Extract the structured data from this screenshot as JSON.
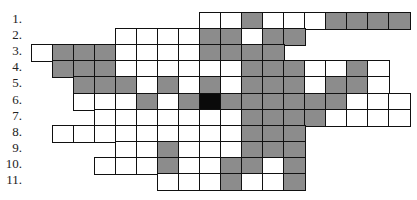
{
  "puzzle": {
    "type": "crossword-grid",
    "row_labels": [
      "1.",
      "2.",
      "3.",
      "4.",
      "5.",
      "6.",
      "7.",
      "8.",
      "9.",
      "10.",
      "11."
    ],
    "legend": {
      "W": "empty cell",
      "G": "shaded cell",
      "B": "black cell",
      ".": "no cell"
    },
    "colors": {
      "shaded": "#8c8c8c",
      "black": "#0a0a0a",
      "border": "#111111"
    },
    "rows": [
      "........WWGWWWGGGG",
      "....WWWWGGWGG.....",
      "WGGGWWWWGGGG......",
      ".GGGWWWWWWGGGWWGW.",
      "..GGGWGWGWGGGWGGW.",
      "..WWWGWGBGGGGGGWWW",
      "...WWWWWWWGGGGWWWW",
      ".WWWWWWWWWGGG.....",
      "....WWGWWWGGG.....",
      "...WWWGWWGGWG.....",
      "......WWWGWWG....."
    ]
  }
}
